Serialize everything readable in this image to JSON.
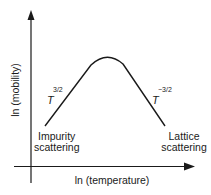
{
  "diagram": {
    "x_axis_label": "ln (temperature)",
    "y_axis_label": "ln (mobility)",
    "left_region": {
      "exponent_base": "T",
      "exponent": "3/2",
      "label_line1": "Impurity",
      "label_line2": "scattering"
    },
    "right_region": {
      "exponent_base": "T",
      "exponent": "−3/2",
      "label_line1": "Lattice",
      "label_line2": "scattering"
    },
    "curve": {
      "shape": "peak",
      "start": [
        45,
        126
      ],
      "peak": [
        107,
        57
      ],
      "end": [
        165,
        126
      ]
    },
    "colors": {
      "line": "#1a1a1a",
      "background": "#ffffff"
    }
  }
}
